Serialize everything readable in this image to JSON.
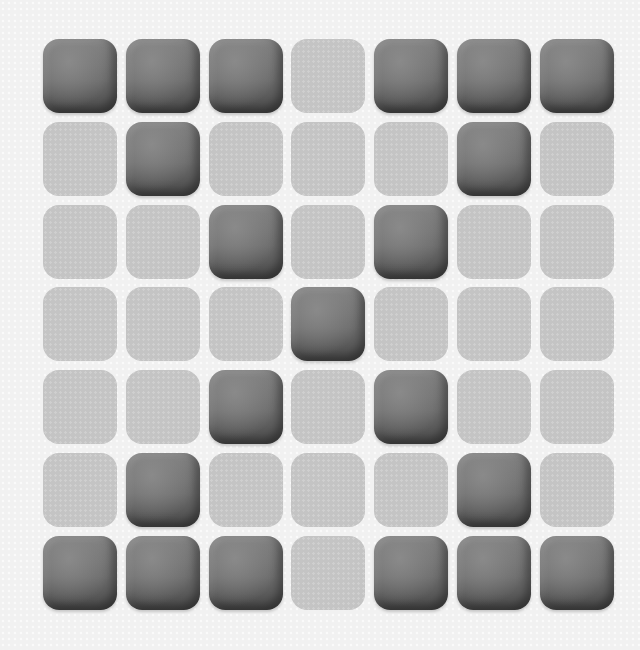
{
  "board": {
    "rows": 7,
    "cols": 7,
    "colors": {
      "on": "#6c6c6c",
      "off": "#c4c4c4",
      "background": "#f1f1f1"
    },
    "grid": [
      [
        1,
        1,
        1,
        0,
        1,
        1,
        1
      ],
      [
        0,
        1,
        0,
        0,
        0,
        1,
        0
      ],
      [
        0,
        0,
        1,
        0,
        1,
        0,
        0
      ],
      [
        0,
        0,
        0,
        1,
        0,
        0,
        0
      ],
      [
        0,
        0,
        1,
        0,
        1,
        0,
        0
      ],
      [
        0,
        1,
        0,
        0,
        0,
        1,
        0
      ],
      [
        1,
        1,
        1,
        0,
        1,
        1,
        1
      ]
    ]
  }
}
